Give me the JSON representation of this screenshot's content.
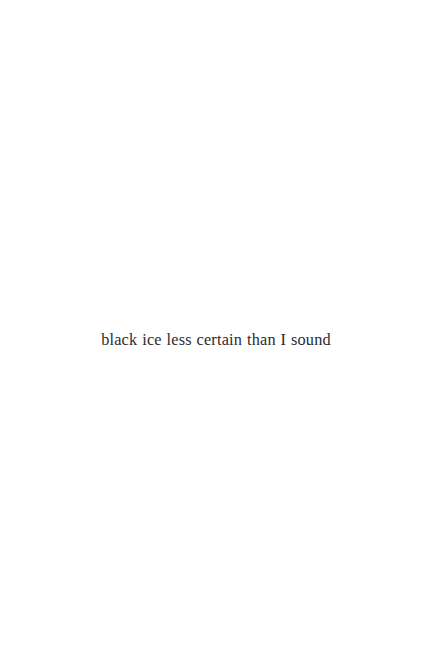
{
  "page": {
    "background_color": "#ffffff",
    "width": 432,
    "height": 670
  },
  "content": {
    "line": "black ice less certain than I sound",
    "ink_color": "#2b2b30",
    "alignment": "center"
  }
}
